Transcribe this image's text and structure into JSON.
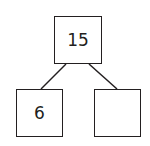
{
  "diagram": {
    "type": "number-bond",
    "whole": "15",
    "parts": [
      "6",
      ""
    ]
  }
}
